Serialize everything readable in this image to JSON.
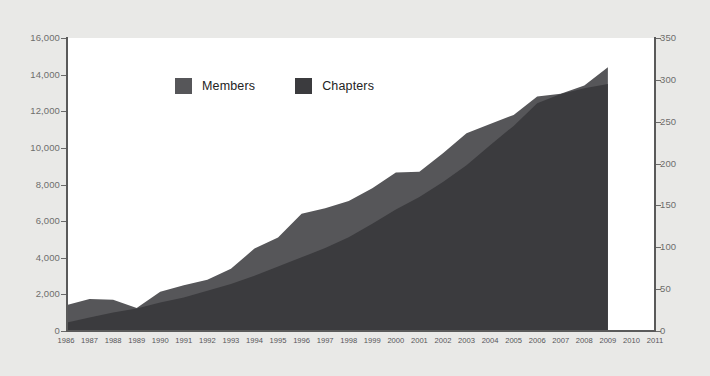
{
  "chart_data": {
    "type": "area",
    "title": "",
    "subtitle": "",
    "xlabel": "",
    "ylabel": "",
    "stacked": true,
    "grid": false,
    "legend_position": "top-center",
    "categories": [
      "1986",
      "1987",
      "1988",
      "1989",
      "1990",
      "1991",
      "1992",
      "1993",
      "1994",
      "1995",
      "1996",
      "1997",
      "1998",
      "1999",
      "2000",
      "2001",
      "2002",
      "2003",
      "2004",
      "2005",
      "2006",
      "2007",
      "2008",
      "2009",
      "2010",
      "2011"
    ],
    "x_axis": {
      "ticks": [
        "1986",
        "1987",
        "1988",
        "1989",
        "1990",
        "1991",
        "1992",
        "1993",
        "1994",
        "1995",
        "1996",
        "1997",
        "1998",
        "1999",
        "2000",
        "2001",
        "2002",
        "2003",
        "2004",
        "2005",
        "2006",
        "2007",
        "2008",
        "2009",
        "2010",
        "2011"
      ],
      "data_end_year": "2009"
    },
    "y_axis_left": {
      "name": "Members",
      "min": 0,
      "max": 16000,
      "step": 2000,
      "ticks": [
        "0",
        "2,000",
        "4,000",
        "6,000",
        "8,000",
        "10,000",
        "12,000",
        "14,000",
        "16,000"
      ]
    },
    "y_axis_right": {
      "name": "Chapters",
      "min": 0,
      "max": 350,
      "step": 50,
      "ticks": [
        "0",
        "50",
        "100",
        "150",
        "200",
        "250",
        "300",
        "350"
      ]
    },
    "series": [
      {
        "name": "Members",
        "axis": "left",
        "color": "#565659",
        "values": [
          1400,
          1750,
          1700,
          1250,
          2150,
          2500,
          2800,
          3400,
          4500,
          5100,
          6400,
          6700,
          7100,
          7800,
          8650,
          8700,
          9700,
          10800,
          11300,
          11800,
          12800,
          12950,
          13400,
          14400,
          null,
          null
        ]
      },
      {
        "name": "Chapters",
        "axis": "right",
        "color": "#3b3b3e",
        "values": [
          10,
          16,
          22,
          27,
          34,
          40,
          48,
          56,
          66,
          77,
          88,
          99,
          112,
          128,
          145,
          160,
          178,
          198,
          222,
          245,
          272,
          283,
          290,
          295,
          null,
          null
        ]
      }
    ]
  },
  "legend": {
    "entries": [
      {
        "label": "Members",
        "color": "#565659"
      },
      {
        "label": "Chapters",
        "color": "#3b3b3e"
      }
    ]
  },
  "colors": {
    "page_background": "#e9e9e7",
    "plot_background": "#ffffff",
    "axis": "#5a5a5a",
    "tick_label": "#6e6e6c",
    "x_tick_label": "#57565a",
    "members_fill": "#565659",
    "chapters_fill": "#3b3b3e"
  }
}
